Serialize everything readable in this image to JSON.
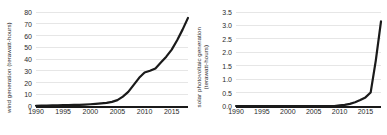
{
  "chart_data": [
    {
      "type": "line",
      "panel": "left",
      "title": "",
      "xlabel": "",
      "ylabel": "wind generation (terawatt-hours)",
      "ylabel_line1": "wind generation (terawatt-hours)",
      "ylabel_line2": "",
      "xlim": [
        1990,
        2018
      ],
      "ylim": [
        0,
        80
      ],
      "grid": true,
      "legend": "none",
      "yticks": [
        "0",
        "10",
        "20",
        "30",
        "40",
        "50",
        "60",
        "70",
        "80"
      ],
      "ytick_values": [
        0,
        10,
        20,
        30,
        40,
        50,
        60,
        70,
        80
      ],
      "xticks": [
        "1990",
        "1995",
        "2000",
        "2005",
        "2010",
        "2015"
      ],
      "xtick_values": [
        1990,
        1995,
        2000,
        2005,
        2010,
        2015
      ],
      "x": [
        1990,
        1991,
        1992,
        1993,
        1994,
        1995,
        1996,
        1997,
        1998,
        1999,
        2000,
        2001,
        2002,
        2003,
        2004,
        2005,
        2006,
        2007,
        2008,
        2009,
        2010,
        2011,
        2012,
        2013,
        2014,
        2015,
        2016,
        2017,
        2018
      ],
      "values": [
        0.2,
        0.3,
        0.4,
        0.5,
        0.6,
        0.7,
        0.8,
        0.9,
        1.0,
        1.2,
        1.5,
        1.8,
        2.2,
        2.6,
        3.5,
        5.0,
        8.0,
        12.0,
        18.0,
        24.0,
        28.5,
        30.0,
        32.0,
        37.0,
        42.0,
        48.0,
        56.0,
        65.0,
        75.0
      ]
    },
    {
      "type": "line",
      "panel": "right",
      "title": "",
      "xlabel": "",
      "ylabel": "solar photovoltaic generation (terawatt-hours)",
      "ylabel_line1": "solar photovoltaic generation",
      "ylabel_line2": "(terawatt-hours)",
      "xlim": [
        1990,
        2018
      ],
      "ylim": [
        0.0,
        3.5
      ],
      "grid": true,
      "legend": "none",
      "yticks": [
        "0.0",
        "0.5",
        "1.0",
        "1.5",
        "2.0",
        "2.5",
        "3.0",
        "3.5"
      ],
      "ytick_values": [
        0.0,
        0.5,
        1.0,
        1.5,
        2.0,
        2.5,
        3.0,
        3.5
      ],
      "xticks": [
        "1990",
        "1995",
        "2000",
        "2005",
        "2010",
        "2015"
      ],
      "xtick_values": [
        1990,
        1995,
        2000,
        2005,
        2010,
        2015
      ],
      "x": [
        1990,
        1991,
        1992,
        1993,
        1994,
        1995,
        1996,
        1997,
        1998,
        1999,
        2000,
        2001,
        2002,
        2003,
        2004,
        2005,
        2006,
        2007,
        2008,
        2009,
        2010,
        2011,
        2012,
        2013,
        2014,
        2015,
        2016,
        2017,
        2018
      ],
      "values": [
        0.0,
        0.0,
        0.0,
        0.0,
        0.0,
        0.0,
        0.0,
        0.0,
        0.0,
        0.0,
        0.0,
        0.0,
        0.0,
        0.0,
        0.0,
        0.0,
        0.0,
        0.0,
        0.0,
        0.0,
        0.02,
        0.04,
        0.08,
        0.14,
        0.22,
        0.32,
        0.5,
        1.7,
        3.15
      ]
    }
  ],
  "colors": {
    "line": "#1a1a1a",
    "grid": "#e6e6e6",
    "axis": "#1a1a1a",
    "text": "#2b2b2b",
    "background": "#ffffff"
  }
}
